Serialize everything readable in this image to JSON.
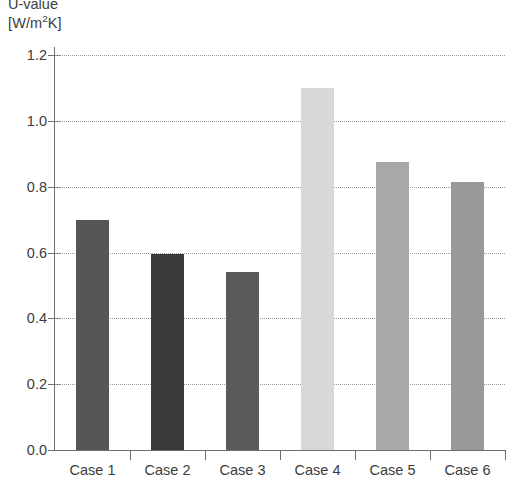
{
  "chart_data": {
    "type": "bar",
    "title": "",
    "axis_title_lines": [
      "U-value",
      "[W/m2K]"
    ],
    "ylabel": "U-value [W/m²K]",
    "xlabel": "",
    "categories": [
      "Case 1",
      "Case 2",
      "Case 3",
      "Case 4",
      "Case 5",
      "Case 6"
    ],
    "values": [
      0.7,
      0.595,
      0.54,
      1.1,
      0.875,
      0.815
    ],
    "bar_colors": [
      "#555555",
      "#3a3a3a",
      "#5a5a5a",
      "#d8d8d8",
      "#a8a8a8",
      "#999999"
    ],
    "ylim": [
      0.0,
      1.2
    ],
    "ytick_values": [
      0.0,
      0.2,
      0.4,
      0.6,
      0.8,
      1.0,
      1.2
    ],
    "ytick_labels": [
      "0.0",
      "0.2",
      "0.4",
      "0.6",
      "0.8",
      "1.0",
      "1.2"
    ],
    "grid": true,
    "grid_style": "dotted",
    "grid_axis": "y",
    "legend": null,
    "legend_position": "none"
  },
  "axis_title": {
    "name": "U-value",
    "unit_prefix": "[W/m",
    "unit_exponent": "2",
    "unit_suffix": "K]"
  }
}
